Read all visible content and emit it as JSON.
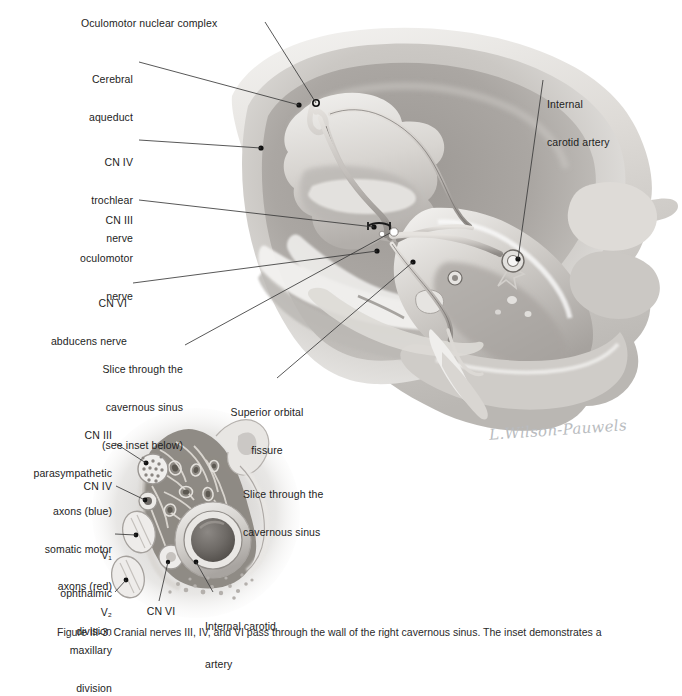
{
  "figure": {
    "signature": "L.Wilson-Pauwels",
    "caption": "Figure III-3.  Cranial nerves III, IV, and VI pass through the wall of the right cavernous sinus. The inset demonstrates a"
  },
  "main_labels": [
    {
      "id": "oculomotor-nuclear-complex",
      "lines": [
        "Oculomotor nuclear complex"
      ],
      "align": "left",
      "x": 81,
      "y": 17,
      "w": 180
    },
    {
      "id": "cerebral-aqueduct",
      "lines": [
        "Cerebral",
        "aqueduct"
      ],
      "align": "right",
      "x": 28,
      "y": 48,
      "w": 105
    },
    {
      "id": "internal-carotid-artery",
      "lines": [
        "Internal",
        "carotid artery"
      ],
      "align": "left",
      "x": 547,
      "y": 73,
      "w": 120
    },
    {
      "id": "cn-iv-trochlear",
      "lines": [
        "CN IV",
        "trochlear",
        "nerve"
      ],
      "align": "right",
      "x": 20,
      "y": 131,
      "w": 113
    },
    {
      "id": "cn-iii-oculomotor",
      "lines": [
        "CN III",
        "oculomotor",
        "nerve"
      ],
      "align": "right",
      "x": 20,
      "y": 189,
      "w": 113
    },
    {
      "id": "cn-vi-abducens",
      "lines": [
        "CN VI",
        "abducens nerve"
      ],
      "align": "right",
      "x": 20,
      "y": 272,
      "w": 107
    },
    {
      "id": "slice-through-cavernous-sinus-inset",
      "lines": [
        "Slice through the",
        "cavernous sinus",
        "(see inset below)"
      ],
      "align": "right",
      "x": 60,
      "y": 338,
      "w": 120
    },
    {
      "id": "superior-orbital-fissure",
      "lines": [
        "Superior orbital",
        "fissure"
      ],
      "align": "center",
      "x": 213,
      "y": 381,
      "w": 100
    }
  ],
  "inset_labels": [
    {
      "id": "cn-iii-axons",
      "lines": [
        "CN III",
        "parasympathetic",
        "axons (blue)",
        "somatic motor",
        "axons (red)"
      ],
      "align": "right",
      "x": 10,
      "y": 404,
      "w": 102
    },
    {
      "id": "cn-iv",
      "lines": [
        "CN IV"
      ],
      "align": "right",
      "x": 40,
      "y": 480,
      "w": 72
    },
    {
      "id": "v1-ophthalmic",
      "lines": [
        "V₁",
        "ophthalmic",
        "division"
      ],
      "align": "right",
      "x": 18,
      "y": 524,
      "w": 94,
      "subscript": "1",
      "sub_word": "V"
    },
    {
      "id": "v2-maxillary",
      "lines": [
        "V₂",
        "maxillary",
        "division"
      ],
      "align": "right",
      "x": 18,
      "y": 581,
      "w": 94,
      "subscript": "2",
      "sub_word": "V"
    },
    {
      "id": "cn-vi",
      "lines": [
        "CN VI"
      ],
      "align": "center",
      "x": 135,
      "y": 605,
      "w": 50
    },
    {
      "id": "internal-carotid-artery-inset",
      "lines": [
        "Internal carotid",
        "artery"
      ],
      "align": "left",
      "x": 205,
      "y": 595,
      "w": 100
    },
    {
      "id": "slice-through-cavernous-sinus",
      "lines": [
        "Slice through the",
        "cavernous sinus"
      ],
      "align": "left",
      "x": 243,
      "y": 463,
      "w": 120
    }
  ],
  "colors": {
    "ink": "#1d1d1d",
    "leader": "#3a3a3a",
    "bone_light": "#e2e0dd",
    "bone_mid": "#c6c3bf",
    "bone_dark": "#a9a5a1",
    "fossa_shadow": "#8e8a86",
    "nerve_stroke": "#6b6763",
    "nerve_fill": "#bfbbb7",
    "signature": "#b9bcc0",
    "white": "#ffffff"
  },
  "structures": {
    "main_view": "right middle cranial fossa, superior view, skull base",
    "inset_view": "coronal slice through the cavernous sinus",
    "nerves_shown": [
      "CN III oculomotor nerve",
      "CN IV trochlear nerve",
      "CN VI abducens nerve"
    ],
    "vessels_shown": [
      "Internal carotid artery"
    ],
    "openings_shown": [
      "Superior orbital fissure",
      "Cerebral aqueduct"
    ]
  }
}
